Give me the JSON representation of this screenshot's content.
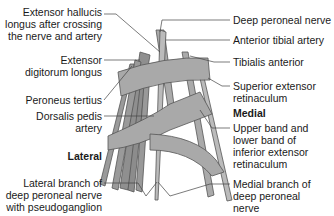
{
  "figure": {
    "labels_left": [
      {
        "id": "ehl",
        "lines": [
          "Extensor hallucis",
          "longus after crossing",
          "the nerve and artery"
        ]
      },
      {
        "id": "edl",
        "lines": [
          "Extensor",
          "digitorum longus"
        ]
      },
      {
        "id": "pt",
        "lines": [
          "Peroneus tertius"
        ]
      },
      {
        "id": "dpa",
        "lines": [
          "Dorsalis pedis",
          "artery"
        ]
      },
      {
        "id": "lat",
        "lines": [
          "Lateral"
        ]
      },
      {
        "id": "lbr",
        "lines": [
          "Lateral branch of",
          "deep peroneal nerve",
          "with pseudoganglion"
        ]
      }
    ],
    "labels_right": [
      {
        "id": "dpn",
        "lines": [
          "Deep peroneal nerve"
        ]
      },
      {
        "id": "ata",
        "lines": [
          "Anterior tibial artery"
        ]
      },
      {
        "id": "ta",
        "lines": [
          "Tibialis anterior"
        ]
      },
      {
        "id": "ser",
        "lines": [
          "Superior extensor",
          "retinaculum"
        ]
      },
      {
        "id": "med",
        "lines": [
          "Medial"
        ]
      },
      {
        "id": "ier",
        "lines": [
          "Upper band and",
          "lower band of",
          "inferior extensor",
          "retinaculum"
        ]
      },
      {
        "id": "mbr",
        "lines": [
          "Medial branch of",
          "deep peroneal",
          "nerve"
        ]
      }
    ],
    "colors": {
      "band": "#a9a9a9",
      "tendon": "#8f8f8f",
      "outline": "#555555",
      "leader": "#444444",
      "text": "#1a1a1a"
    }
  }
}
